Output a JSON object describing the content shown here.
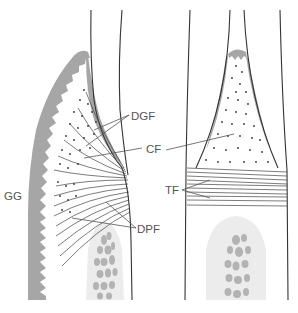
{
  "figure": {
    "panels": [
      {
        "id": "left",
        "description": "Facial/lingual section through gingiva and tooth"
      },
      {
        "id": "right",
        "description": "Interproximal section between adjacent teeth"
      }
    ]
  },
  "labels": {
    "gg": "GG",
    "dgf": "DGF",
    "cf": "CF",
    "tf": "TF",
    "dpf": "DPF"
  },
  "colors": {
    "epithelium": "#a6a6a6",
    "bone_bg": "#ececec",
    "bone_trabeculae": "#b3b3b3",
    "line": "#333333",
    "label": "#555555"
  }
}
